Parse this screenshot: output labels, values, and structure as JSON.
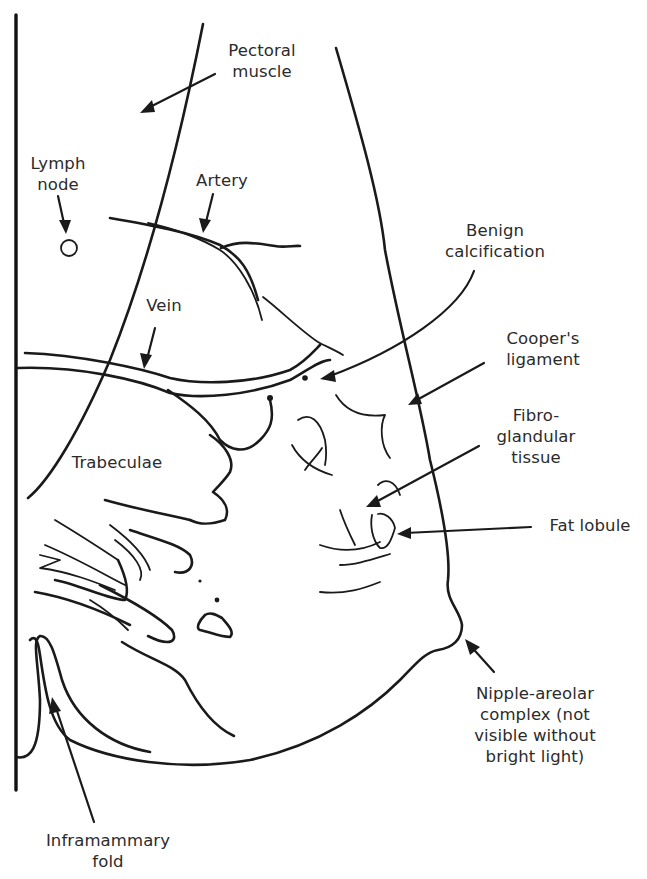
{
  "diagram": {
    "type": "anatomical line drawing",
    "labels": {
      "pectoral_muscle": "Pectoral\nmuscle",
      "lymph_node": "Lymph\nnode",
      "artery": "Artery",
      "benign_calcification": "Benign\ncalcification",
      "vein": "Vein",
      "coopers_ligament": "Cooper's\nligament",
      "fibroglandular_tissue": "Fibro-\nglandular\ntissue",
      "trabeculae": "Trabeculae",
      "fat_lobule": "Fat lobule",
      "nipple_areolar_complex": "Nipple-areolar\ncomplex (not\nvisible without\nbright light)",
      "inframammary_fold": "Inframammary\nfold"
    },
    "colors": {
      "line": "#1a1a1a",
      "text": "#2b2b2b",
      "background": "#ffffff"
    }
  }
}
